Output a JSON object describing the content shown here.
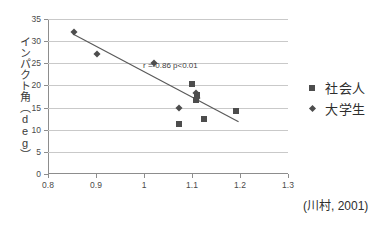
{
  "chart_data": {
    "type": "scatter",
    "title": "",
    "xlabel": "",
    "ylabel": "インパクト角（deg）",
    "xlim": [
      0.8,
      1.3
    ],
    "ylim": [
      0,
      35
    ],
    "xticks": [
      "0.8",
      "0.9",
      "1",
      "1.1",
      "1.2",
      "1.3"
    ],
    "xtick_values": [
      0.8,
      0.9,
      1.0,
      1.1,
      1.2,
      1.3
    ],
    "yticks": [
      "0",
      "5",
      "10",
      "15",
      "20",
      "25",
      "30",
      "35"
    ],
    "ytick_values": [
      0,
      5,
      10,
      15,
      20,
      25,
      30,
      35
    ],
    "grid": "horizontal",
    "legend_position": "right",
    "annotation": "r =-0.86 p<0.01",
    "annotation_at": [
      1.055,
      24.4
    ],
    "citation": "(川村, 2001)",
    "series": [
      {
        "name": "社会人",
        "marker": "square",
        "color": "#4d4d4d",
        "points": [
          {
            "x": 1.072,
            "y": 11.2
          },
          {
            "x": 1.1,
            "y": 20.3
          },
          {
            "x": 1.108,
            "y": 16.8
          },
          {
            "x": 1.11,
            "y": 17.9
          },
          {
            "x": 1.125,
            "y": 12.5
          },
          {
            "x": 1.192,
            "y": 14.2
          }
        ]
      },
      {
        "name": "大学生",
        "marker": "diamond",
        "color": "#4d4d4d",
        "points": [
          {
            "x": 0.855,
            "y": 32.0
          },
          {
            "x": 0.903,
            "y": 27.0
          },
          {
            "x": 1.02,
            "y": 25.0
          },
          {
            "x": 1.072,
            "y": 15.0
          },
          {
            "x": 1.108,
            "y": 18.2
          },
          {
            "x": 1.11,
            "y": 17.2
          }
        ]
      }
    ],
    "trendline": {
      "x0": 0.852,
      "y0": 31.6,
      "x1": 1.197,
      "y1": 11.8,
      "color": "#5a5a5a"
    }
  },
  "legend": {
    "items": [
      {
        "label": "社会人",
        "marker": "square"
      },
      {
        "label": "大学生",
        "marker": "diamond"
      }
    ]
  }
}
